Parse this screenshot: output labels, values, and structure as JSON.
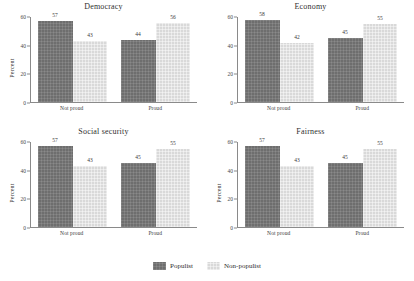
{
  "chart_data": {
    "type": "bar",
    "title": "",
    "xlabel": "",
    "ylabel": "Percent",
    "ylim": [
      0,
      60
    ],
    "yticks": [
      0,
      20,
      40,
      60
    ],
    "grid": false,
    "legend_position": "bottom",
    "categories": [
      "Not proud",
      "Proud"
    ],
    "legend": [
      "Populist",
      "Non-populist"
    ],
    "panels": [
      {
        "title": "Democracy",
        "ylabel": "Percent",
        "categories": [
          "Not proud",
          "Proud"
        ],
        "series": [
          {
            "name": "Populist",
            "values": [
              57,
              44
            ]
          },
          {
            "name": "Non-populist",
            "values": [
              43,
              56
            ]
          }
        ]
      },
      {
        "title": "Economy",
        "ylabel": "",
        "categories": [
          "Not proud",
          "Proud"
        ],
        "series": [
          {
            "name": "Populist",
            "values": [
              58,
              45
            ]
          },
          {
            "name": "Non-populist",
            "values": [
              42,
              55
            ]
          }
        ]
      },
      {
        "title": "Social security",
        "ylabel": "Percent",
        "categories": [
          "Not proud",
          "Proud"
        ],
        "series": [
          {
            "name": "Populist",
            "values": [
              57,
              45
            ]
          },
          {
            "name": "Non-populist",
            "values": [
              43,
              55
            ]
          }
        ]
      },
      {
        "title": "Fairness",
        "ylabel": "Percent",
        "categories": [
          "Not proud",
          "Proud"
        ],
        "series": [
          {
            "name": "Populist",
            "values": [
              57,
              45
            ]
          },
          {
            "name": "Non-populist",
            "values": [
              43,
              55
            ]
          }
        ]
      }
    ],
    "colors": {
      "populist": "#6e6e6e",
      "non_populist": "#d9d9d9",
      "axis": "#8a8a8a",
      "text": "#3a3a3a"
    }
  },
  "panels": {
    "p0": {
      "title": "Democracy",
      "ylabel": "Percent",
      "cat0": "Not proud",
      "cat1": "Proud",
      "v00": "57",
      "v01": "43",
      "v10": "44",
      "v11": "56"
    },
    "p1": {
      "title": "Economy",
      "ylabel": "",
      "cat0": "Not proud",
      "cat1": "Proud",
      "v00": "58",
      "v01": "42",
      "v10": "45",
      "v11": "55"
    },
    "p2": {
      "title": "Social security",
      "ylabel": "Percent",
      "cat0": "Not proud",
      "cat1": "Proud",
      "v00": "57",
      "v01": "43",
      "v10": "45",
      "v11": "55"
    },
    "p3": {
      "title": "Fairness",
      "ylabel": "Percent",
      "cat0": "Not proud",
      "cat1": "Proud",
      "v00": "57",
      "v01": "43",
      "v10": "45",
      "v11": "55"
    }
  },
  "axis": {
    "tick0": "0",
    "tick1": "20",
    "tick2": "40",
    "tick3": "60"
  },
  "legend": {
    "populist": "Populist",
    "non_populist": "Non-populist"
  }
}
